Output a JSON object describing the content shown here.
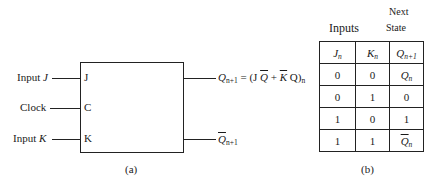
{
  "diagram_a": {
    "caption": "(a)",
    "inputs": [
      {
        "label": "Input",
        "var": "J",
        "pin": "J"
      },
      {
        "label": "Clock",
        "var": "",
        "pin": "C"
      },
      {
        "label": "Input",
        "var": "K",
        "pin": "K"
      }
    ],
    "outputs": {
      "q_next": {
        "sym": "Q",
        "sub": "n+1",
        "eq_prefix": "= (J ",
        "q_bar": "Q",
        "plus": " + ",
        "k_bar": "K",
        "q": " Q)",
        "eq_sub": "n"
      },
      "q_next_bar": {
        "sym": "Q",
        "sub": "n+1"
      }
    }
  },
  "table_b": {
    "caption": "(b)",
    "group_headers": {
      "inputs": "Inputs",
      "next_state_1": "Next",
      "next_state_2": "State"
    },
    "columns": [
      {
        "sym": "J",
        "sub": "n"
      },
      {
        "sym": "K",
        "sub": "n"
      },
      {
        "sym": "Q",
        "sub": "n+1"
      }
    ],
    "rows": [
      {
        "j": "0",
        "k": "0",
        "q": "Qn"
      },
      {
        "j": "0",
        "k": "1",
        "q": "0"
      },
      {
        "j": "1",
        "k": "0",
        "q": "1"
      },
      {
        "j": "1",
        "k": "1",
        "q": "Q̄n"
      }
    ]
  }
}
